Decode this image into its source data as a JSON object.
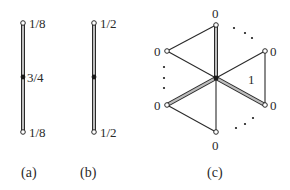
{
  "figure": {
    "colors": {
      "ink": "#2a2a2a",
      "double_edge_fill": "#bdbdbd",
      "background": "#ffffff"
    },
    "panels": [
      {
        "id": "a",
        "caption": "(a)",
        "top_label": "1/8",
        "middle_label": "3/4",
        "bottom_label": "1/8"
      },
      {
        "id": "b",
        "caption": "(b)",
        "top_label": "1/2",
        "bottom_label": "1/2"
      },
      {
        "id": "c",
        "caption": "(c)",
        "vertex_labels": {
          "top": "0",
          "upper_left": "0",
          "upper_right": "0",
          "lower_left": "0",
          "lower_right": "0",
          "bottom": "0"
        },
        "face_label": "1",
        "ellipsis": "…"
      }
    ]
  }
}
